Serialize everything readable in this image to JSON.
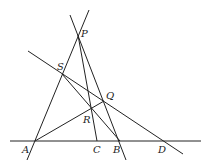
{
  "diagram": {
    "type": "geometry",
    "points": {
      "P": {
        "label": "P",
        "x": 78,
        "y": 35
      },
      "S": {
        "label": "S",
        "x": 62,
        "y": 74
      },
      "Q": {
        "label": "Q",
        "x": 104,
        "y": 101
      },
      "R": {
        "label": "R",
        "x": 90,
        "y": 108
      },
      "A": {
        "label": "A",
        "x": 35,
        "y": 141
      },
      "C": {
        "label": "C",
        "x": 97,
        "y": 141
      },
      "B": {
        "label": "B",
        "x": 120,
        "y": 141
      },
      "D": {
        "label": "D",
        "x": 164,
        "y": 141
      }
    },
    "lines": [
      "A-P (extended)",
      "P-B (extended)",
      "P-C",
      "S-Q-D (extended)",
      "S-B",
      "A-Q",
      "A-B-D baseline"
    ]
  }
}
